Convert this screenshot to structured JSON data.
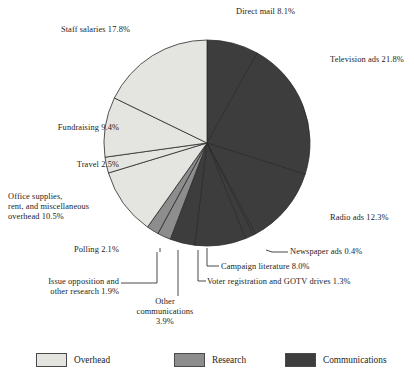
{
  "chart_data": {
    "type": "pie",
    "title": "",
    "subtitle": "",
    "xlabel": "",
    "ylabel": "",
    "legend_position": "bottom",
    "grid": false,
    "total_percent": 100.0,
    "start_angle_deg": 0,
    "direction": "clockwise",
    "categories": [
      "Direct mail",
      "Television ads",
      "Radio ads",
      "Newspaper ads",
      "Voter registration and GOTV drives",
      "Campaign literature",
      "Other communications",
      "Polling",
      "Issue opposition and other research",
      "Office supplies, rent, and miscellaneous overhead",
      "Travel",
      "Fundraising",
      "Staff salaries"
    ],
    "values": [
      8.1,
      21.8,
      12.3,
      0.4,
      1.3,
      8.0,
      3.9,
      2.1,
      1.9,
      10.5,
      2.5,
      9.4,
      17.8
    ],
    "groups": [
      "Communications",
      "Communications",
      "Communications",
      "Communications",
      "Communications",
      "Communications",
      "Communications",
      "Research",
      "Research",
      "Overhead",
      "Overhead",
      "Overhead",
      "Overhead"
    ],
    "slices": [
      {
        "label": "Direct mail",
        "value": 8.1,
        "group": "Communications",
        "color": "#3d3d3d"
      },
      {
        "label": "Television ads",
        "value": 21.8,
        "group": "Communications",
        "color": "#3d3d3d"
      },
      {
        "label": "Radio ads",
        "value": 12.3,
        "group": "Communications",
        "color": "#3d3d3d"
      },
      {
        "label": "Newspaper ads",
        "value": 0.4,
        "group": "Communications",
        "color": "#3d3d3d"
      },
      {
        "label": "Voter registration and GOTV drives",
        "value": 1.3,
        "group": "Communications",
        "color": "#3d3d3d"
      },
      {
        "label": "Campaign literature",
        "value": 8.0,
        "group": "Communications",
        "color": "#3d3d3d"
      },
      {
        "label": "Other communications",
        "value": 3.9,
        "group": "Communications",
        "color": "#3d3d3d"
      },
      {
        "label": "Polling",
        "value": 2.1,
        "group": "Research",
        "color": "#8d8d8d"
      },
      {
        "label": "Issue opposition and other research",
        "value": 1.9,
        "group": "Research",
        "color": "#8d8d8d"
      },
      {
        "label": "Office supplies, rent, and miscellaneous overhead",
        "value": 10.5,
        "group": "Overhead",
        "color": "#e4e4e0"
      },
      {
        "label": "Travel",
        "value": 2.5,
        "group": "Overhead",
        "color": "#e4e4e0"
      },
      {
        "label": "Fundraising",
        "value": 9.4,
        "group": "Overhead",
        "color": "#e4e4e0"
      },
      {
        "label": "Staff salaries",
        "value": 17.8,
        "group": "Overhead",
        "color": "#e4e4e0"
      }
    ]
  },
  "labels": {
    "direct_mail": "Direct mail 8.1%",
    "television": "Television ads 21.8%",
    "radio": "Radio ads 12.3%",
    "newspaper": "Newspaper ads 0.4%",
    "campaign_literature": "Campaign literature 8.0%",
    "voter_registration": "Voter registration and GOTV drives 1.3%",
    "other_communications": "Other\ncommunications\n3.9%",
    "polling": "Polling 2.1%",
    "issue_opposition": "Issue opposition and\nother research 1.9%",
    "office_supplies": "Office supplies,\nrent, and miscellaneous\noverhead 10.5%",
    "travel": "Travel 2.5%",
    "fundraising": "Fundraising 9.4%",
    "staff_salaries": "Staff salaries 17.8%"
  },
  "legend": {
    "items": [
      {
        "label": "Overhead",
        "color": "#e4e4e0"
      },
      {
        "label": "Research",
        "color": "#8d8d8d"
      },
      {
        "label": "Communications",
        "color": "#3d3d3d"
      }
    ]
  },
  "colors": {
    "overhead": "#e4e4e0",
    "research": "#8d8d8d",
    "communications": "#3d3d3d",
    "outline": "#2b2b2b",
    "text": "#1c1c1c",
    "background": "#ffffff"
  },
  "geometry": {
    "center_x": 207,
    "center_y": 143,
    "radius": 103
  }
}
